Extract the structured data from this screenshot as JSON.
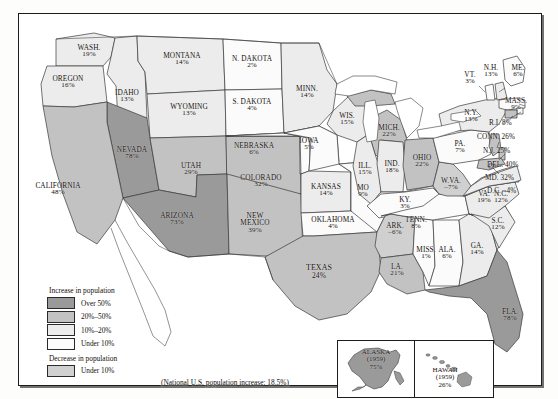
{
  "map": {
    "title": "U.S. population change by state",
    "national_note": "(National U.S. population increase: 18.5%)",
    "colors": {
      "over_50": "#9a9a9a",
      "20_to_50": "#c2c2c2",
      "10_to_20": "#e8e8e8",
      "under_10": "#fbfbfb",
      "decrease": "#d0d0d0",
      "ocean": "#ffffff",
      "outline": "#3a3a3a",
      "frame": "#1c1c1c"
    }
  },
  "legend": {
    "heading_increase": "Increase in population",
    "heading_decrease": "Decrease in population",
    "items": [
      {
        "label": "Over 50%",
        "swatch": "#9a9a9a",
        "group": "increase"
      },
      {
        "label": "20%–50%",
        "swatch": "#c2c2c2",
        "group": "increase"
      },
      {
        "label": "10%–20%",
        "swatch": "#ececec",
        "group": "increase"
      },
      {
        "label": "Under 10%",
        "swatch": "#fcfcfc",
        "group": "increase"
      },
      {
        "label": "Under 10%",
        "swatch": "#d0d0d0",
        "group": "decrease"
      }
    ]
  },
  "states": [
    {
      "name": "WASH.",
      "value": "19%",
      "class": "10_to_20"
    },
    {
      "name": "OREGON",
      "value": "16%",
      "class": "10_to_20"
    },
    {
      "name": "IDAHO",
      "value": "13%",
      "class": "10_to_20"
    },
    {
      "name": "MONTANA",
      "value": "14%",
      "class": "10_to_20"
    },
    {
      "name": "WYOMING",
      "value": "13%",
      "class": "10_to_20"
    },
    {
      "name": "N. DAKOTA",
      "value": "2%",
      "class": "under_10"
    },
    {
      "name": "S. DAKOTA",
      "value": "4%",
      "class": "under_10"
    },
    {
      "name": "NEBRASKA",
      "value": "6%",
      "class": "under_10"
    },
    {
      "name": "MINN.",
      "value": "14%",
      "class": "10_to_20"
    },
    {
      "name": "IOWA",
      "value": "5%",
      "class": "under_10"
    },
    {
      "name": "WIS.",
      "value": "15%",
      "class": "10_to_20"
    },
    {
      "name": "NEVADA",
      "value": "78%",
      "class": "over_50"
    },
    {
      "name": "CALIFORNIA",
      "value": "48%",
      "class": "20_to_50"
    },
    {
      "name": "UTAH",
      "value": "29%",
      "class": "20_to_50"
    },
    {
      "name": "COLORADO",
      "value": "32%",
      "class": "20_to_50"
    },
    {
      "name": "ARIZONA",
      "value": "73%",
      "class": "over_50"
    },
    {
      "name": "NEW MEXICO",
      "value": "39%",
      "class": "20_to_50"
    },
    {
      "name": "KANSAS",
      "value": "14%",
      "class": "10_to_20"
    },
    {
      "name": "OKLAHOMA",
      "value": "4%",
      "class": "under_10"
    },
    {
      "name": "TEXAS",
      "value": "24%",
      "class": "20_to_50"
    },
    {
      "name": "MO",
      "value": "9%",
      "class": "under_10"
    },
    {
      "name": "ARK.",
      "value": "–6%",
      "class": "decrease"
    },
    {
      "name": "LA.",
      "value": "21%",
      "class": "20_to_50"
    },
    {
      "name": "MISS.",
      "value": "1%",
      "class": "under_10"
    },
    {
      "name": "ILL.",
      "value": "15%",
      "class": "10_to_20"
    },
    {
      "name": "IND.",
      "value": "18%",
      "class": "10_to_20"
    },
    {
      "name": "MICH.",
      "value": "22%",
      "class": "20_to_50"
    },
    {
      "name": "OHIO",
      "value": "22%",
      "class": "20_to_50"
    },
    {
      "name": "KY.",
      "value": "3%",
      "class": "under_10"
    },
    {
      "name": "TENN.",
      "value": "8%",
      "class": "under_10"
    },
    {
      "name": "ALA.",
      "value": "6%",
      "class": "under_10"
    },
    {
      "name": "GA.",
      "value": "14%",
      "class": "10_to_20"
    },
    {
      "name": "FLA.",
      "value": "78%",
      "class": "over_50"
    },
    {
      "name": "S.C.",
      "value": "12%",
      "class": "10_to_20"
    },
    {
      "name": "N.C.",
      "value": "12%",
      "class": "10_to_20"
    },
    {
      "name": "W.VA.",
      "value": "–7%",
      "class": "decrease"
    },
    {
      "name": "VA.",
      "value": "19%",
      "class": "10_to_20"
    },
    {
      "name": "PA.",
      "value": "7%",
      "class": "under_10"
    },
    {
      "name": "N.Y.",
      "value": "13%",
      "class": "10_to_20"
    },
    {
      "name": "VT.",
      "value": "3%",
      "class": "under_10"
    },
    {
      "name": "N.H.",
      "value": "13%",
      "class": "10_to_20"
    },
    {
      "name": "ME.",
      "value": "6%",
      "class": "under_10"
    },
    {
      "name": "MASS.",
      "value": "9%",
      "class": "under_10"
    },
    {
      "name": "R.I.",
      "value": "8%",
      "class": "under_10"
    },
    {
      "name": "CONN.",
      "value": "26%",
      "class": "20_to_50"
    },
    {
      "name": "N.J.",
      "value": "25%",
      "class": "20_to_50"
    },
    {
      "name": "DEL.",
      "value": "40%",
      "class": "20_to_50"
    },
    {
      "name": "MD.",
      "value": "32%",
      "class": "20_to_50"
    },
    {
      "name": "D.C.",
      "value": "–4%",
      "class": "decrease"
    }
  ],
  "labels": {
    "wash_n": "WASH.",
    "wash_v": "19%",
    "oregon_n": "OREGON",
    "oregon_v": "16%",
    "idaho_n": "IDAHO",
    "idaho_v": "13%",
    "montana_n": "MONTANA",
    "montana_v": "14%",
    "wyoming_n": "WYOMING",
    "wyoming_v": "13%",
    "ndak_n": "N. DAKOTA",
    "ndak_v": "2%",
    "sdak_n": "S. DAKOTA",
    "sdak_v": "4%",
    "nebr_n": "NEBRASKA",
    "nebr_v": "6%",
    "minn_n": "MINN.",
    "minn_v": "14%",
    "iowa_n": "IOWA",
    "iowa_v": "5%",
    "wis_n": "WIS.",
    "wis_v": "15%",
    "nevada_n": "NEVADA",
    "nevada_v": "78%",
    "calif_n": "CALIFORNIA",
    "calif_v": "48%",
    "utah_n": "UTAH",
    "utah_v": "29%",
    "colo_n": "COLORADO",
    "colo_v": "32%",
    "ariz_n": "ARIZONA",
    "ariz_v": "73%",
    "nmex_n": "NEW",
    "nmex_n2": "MEXICO",
    "nmex_v": "39%",
    "kansas_n": "KANSAS",
    "kansas_v": "14%",
    "okla_n": "OKLAHOMA",
    "okla_v": "4%",
    "texas_n": "TEXAS",
    "texas_v": "24%",
    "mo_n": "MO",
    "mo_v": "9%",
    "ark_n": "ARK.",
    "ark_v": "–6%",
    "la_n": "LA.",
    "la_v": "21%",
    "miss_n": "MISS.",
    "miss_v": "1%",
    "ill_n": "ILL.",
    "ill_v": "15%",
    "ind_n": "IND.",
    "ind_v": "18%",
    "mich_n": "MICH.",
    "mich_v": "22%",
    "ohio_n": "OHIO",
    "ohio_v": "22%",
    "ky_n": "KY.",
    "ky_v": "3%",
    "tenn_n": "TENN.",
    "tenn_v": "8%",
    "ala_n": "ALA.",
    "ala_v": "6%",
    "ga_n": "GA.",
    "ga_v": "14%",
    "fla_n": "FLA.",
    "fla_v": "78%",
    "sc_n": "S.C.",
    "sc_v": "12%",
    "nc_n": "N.C.",
    "nc_v": "12%",
    "wva_n": "W.VA.",
    "wva_v": "–7%",
    "va_n": "VA.",
    "va_v": "19%",
    "pa_n": "PA.",
    "pa_v": "7%",
    "ny_n": "N.Y.",
    "ny_v": "13%",
    "vt_n": "VT.",
    "vt_v": "3%",
    "nh_n": "N.H.",
    "nh_v": "13%",
    "me_n": "ME.",
    "me_v": "6%",
    "mass_n": "MASS.",
    "mass_v": "9%",
    "ri": "R.I. 8%",
    "conn": "CONN. 26%",
    "nj": "N.J. 25%",
    "del": "DEL. 40%",
    "md": "MD. 32%",
    "dc": "D.C. –4%"
  },
  "inset": {
    "alaska_name": "ALASKA",
    "alaska_year": "(1959)",
    "alaska_value": "75%",
    "hawaii_name": "HAWAII",
    "hawaii_year": "(1959)",
    "hawaii_value": "26%"
  }
}
